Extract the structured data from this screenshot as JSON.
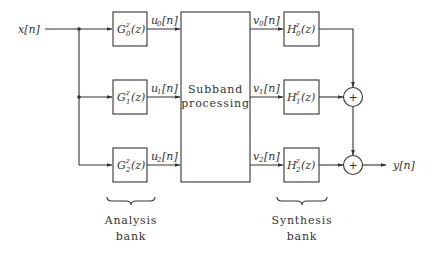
{
  "input": {
    "label": "x[n]"
  },
  "output": {
    "label": "y[n]"
  },
  "analysis_filters": [
    {
      "name": "G",
      "sup": "z",
      "sub": "0",
      "arg": "(z)",
      "output_signal": "u",
      "output_index": "0",
      "output_suffix": "[n]"
    },
    {
      "name": "G",
      "sup": "z",
      "sub": "1",
      "arg": "(z)",
      "output_signal": "u",
      "output_index": "1",
      "output_suffix": "[n]"
    },
    {
      "name": "G",
      "sup": "z",
      "sub": "2",
      "arg": "(z)",
      "output_signal": "u",
      "output_index": "2",
      "output_suffix": "[n]"
    }
  ],
  "processing": {
    "line1": "Subband",
    "line2": "processing"
  },
  "synthesis_filters": [
    {
      "name": "H",
      "sup": "z",
      "sub": "0",
      "arg": "(z)",
      "input_signal": "v",
      "input_index": "0",
      "input_suffix": "[n]"
    },
    {
      "name": "H",
      "sup": "z",
      "sub": "1",
      "arg": "(z)",
      "input_signal": "v",
      "input_index": "1",
      "input_suffix": "[n]"
    },
    {
      "name": "H",
      "sup": "z",
      "sub": "2",
      "arg": "(z)",
      "input_signal": "v",
      "input_index": "2",
      "input_suffix": "[n]"
    }
  ],
  "adders": [
    {
      "symbol": "+"
    },
    {
      "symbol": "+"
    }
  ],
  "brace_labels": {
    "analysis": {
      "line1": "Analysis",
      "line2": "bank"
    },
    "synthesis": {
      "line1": "Synthesis",
      "line2": "bank"
    }
  }
}
